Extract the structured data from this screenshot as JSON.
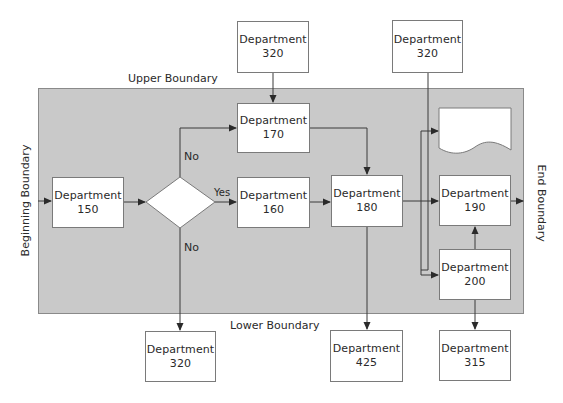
{
  "diagram": {
    "type": "cross-functional process flow",
    "colors": {
      "boundary_fill": "#c9c9c9",
      "box_fill": "#ffffff",
      "line": "#3a3a3a"
    },
    "boundaries": {
      "upper": "Upper Boundary",
      "lower": "Lower Boundary",
      "beginning": "Beginning Boundary",
      "end": "End Boundary"
    },
    "nodes": {
      "dept_320_top_left": {
        "line1": "Department",
        "line2": "320"
      },
      "dept_320_top_right": {
        "line1": "Department",
        "line2": "320"
      },
      "dept_150": {
        "line1": "Department",
        "line2": "150"
      },
      "decision": {
        "label": ""
      },
      "dept_170": {
        "line1": "Department",
        "line2": "170"
      },
      "dept_160": {
        "line1": "Department",
        "line2": "160"
      },
      "dept_180": {
        "line1": "Department",
        "line2": "180"
      },
      "document": {
        "label": ""
      },
      "dept_190": {
        "line1": "Department",
        "line2": "190"
      },
      "dept_200": {
        "line1": "Department",
        "line2": "200"
      },
      "dept_320_bottom": {
        "line1": "Department",
        "line2": "320"
      },
      "dept_425": {
        "line1": "Department",
        "line2": "425"
      },
      "dept_315": {
        "line1": "Department",
        "line2": "315"
      }
    },
    "edge_labels": {
      "no_up": "No",
      "yes": "Yes",
      "no_down": "No"
    },
    "edges": [
      {
        "from": "Beginning Boundary",
        "to": "Department 150"
      },
      {
        "from": "Department 150",
        "to": "Decision"
      },
      {
        "from": "Decision",
        "to": "Department 170",
        "label": "No"
      },
      {
        "from": "Decision",
        "to": "Department 160",
        "label": "Yes"
      },
      {
        "from": "Decision",
        "to": "Department 320 (bottom)",
        "label": "No"
      },
      {
        "from": "Department 320 (top left)",
        "to": "Department 170"
      },
      {
        "from": "Department 170",
        "to": "Department 180"
      },
      {
        "from": "Department 160",
        "to": "Department 180"
      },
      {
        "from": "Department 180",
        "to": "Department 190"
      },
      {
        "from": "Department 180",
        "to": "Document"
      },
      {
        "from": "Department 180",
        "to": "Department 200"
      },
      {
        "from": "Department 320 (top right)",
        "to": "Department 200"
      },
      {
        "from": "Department 180",
        "to": "Department 425"
      },
      {
        "from": "Department 200",
        "to": "Department 190"
      },
      {
        "from": "Department 200",
        "to": "Department 315"
      },
      {
        "from": "Department 190",
        "to": "End Boundary"
      }
    ]
  }
}
